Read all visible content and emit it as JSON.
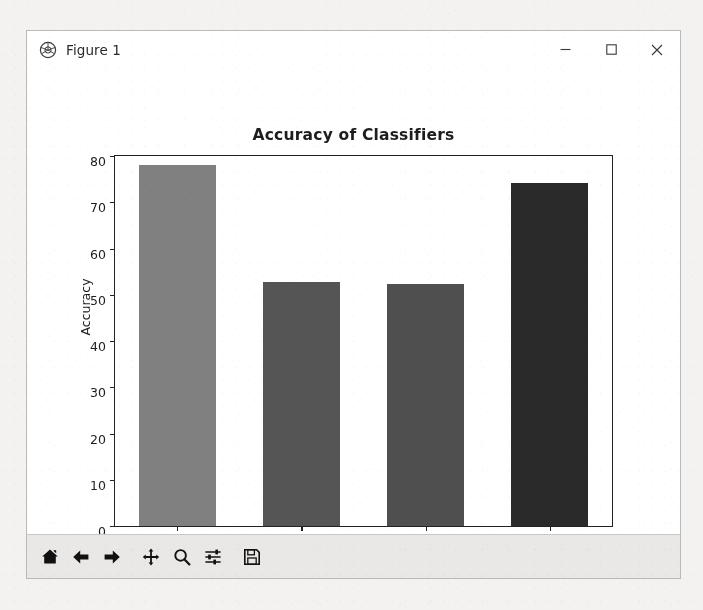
{
  "window": {
    "title": "Figure 1",
    "app_icon": "matplotlib-icon",
    "controls": {
      "minimize": "minimize-icon",
      "maximize": "maximize-icon",
      "close": "close-icon"
    }
  },
  "toolbar": {
    "buttons": [
      {
        "name": "home-button",
        "icon": "home-icon",
        "tooltip": "Reset original view"
      },
      {
        "name": "back-button",
        "icon": "arrow-left-icon",
        "tooltip": "Back to previous view"
      },
      {
        "name": "forward-button",
        "icon": "arrow-right-icon",
        "tooltip": "Forward to next view"
      },
      {
        "name": "pan-button",
        "icon": "move-icon",
        "tooltip": "Pan axes with left mouse, zoom with right"
      },
      {
        "name": "zoom-button",
        "icon": "magnifier-icon",
        "tooltip": "Zoom to rectangle"
      },
      {
        "name": "configure-subplots-button",
        "icon": "sliders-icon",
        "tooltip": "Configure subplots"
      },
      {
        "name": "save-button",
        "icon": "floppy-disk-icon",
        "tooltip": "Save the figure"
      }
    ]
  },
  "chart_data": {
    "type": "bar",
    "title": "Accuracy of Classifiers",
    "xlabel": "",
    "ylabel": "Accuracy",
    "categories": [
      "ialNB",
      "ulliNB",
      "SVC",
      "Bayes"
    ],
    "values": [
      78.1,
      52.8,
      52.3,
      74.1
    ],
    "bar_colors": [
      "#808080",
      "#555555",
      "#4f4f4f",
      "#2a2a2a"
    ],
    "ylim": [
      0,
      80
    ],
    "yticks": [
      0,
      10,
      20,
      30,
      40,
      50,
      60,
      70,
      80
    ],
    "ytick_labels": [
      "0",
      "10",
      "20",
      "30",
      "40",
      "50",
      "60",
      "70",
      "80"
    ],
    "xtick_rotation": 90,
    "grid": false,
    "legend": null,
    "bar_width_fraction": 0.62
  }
}
